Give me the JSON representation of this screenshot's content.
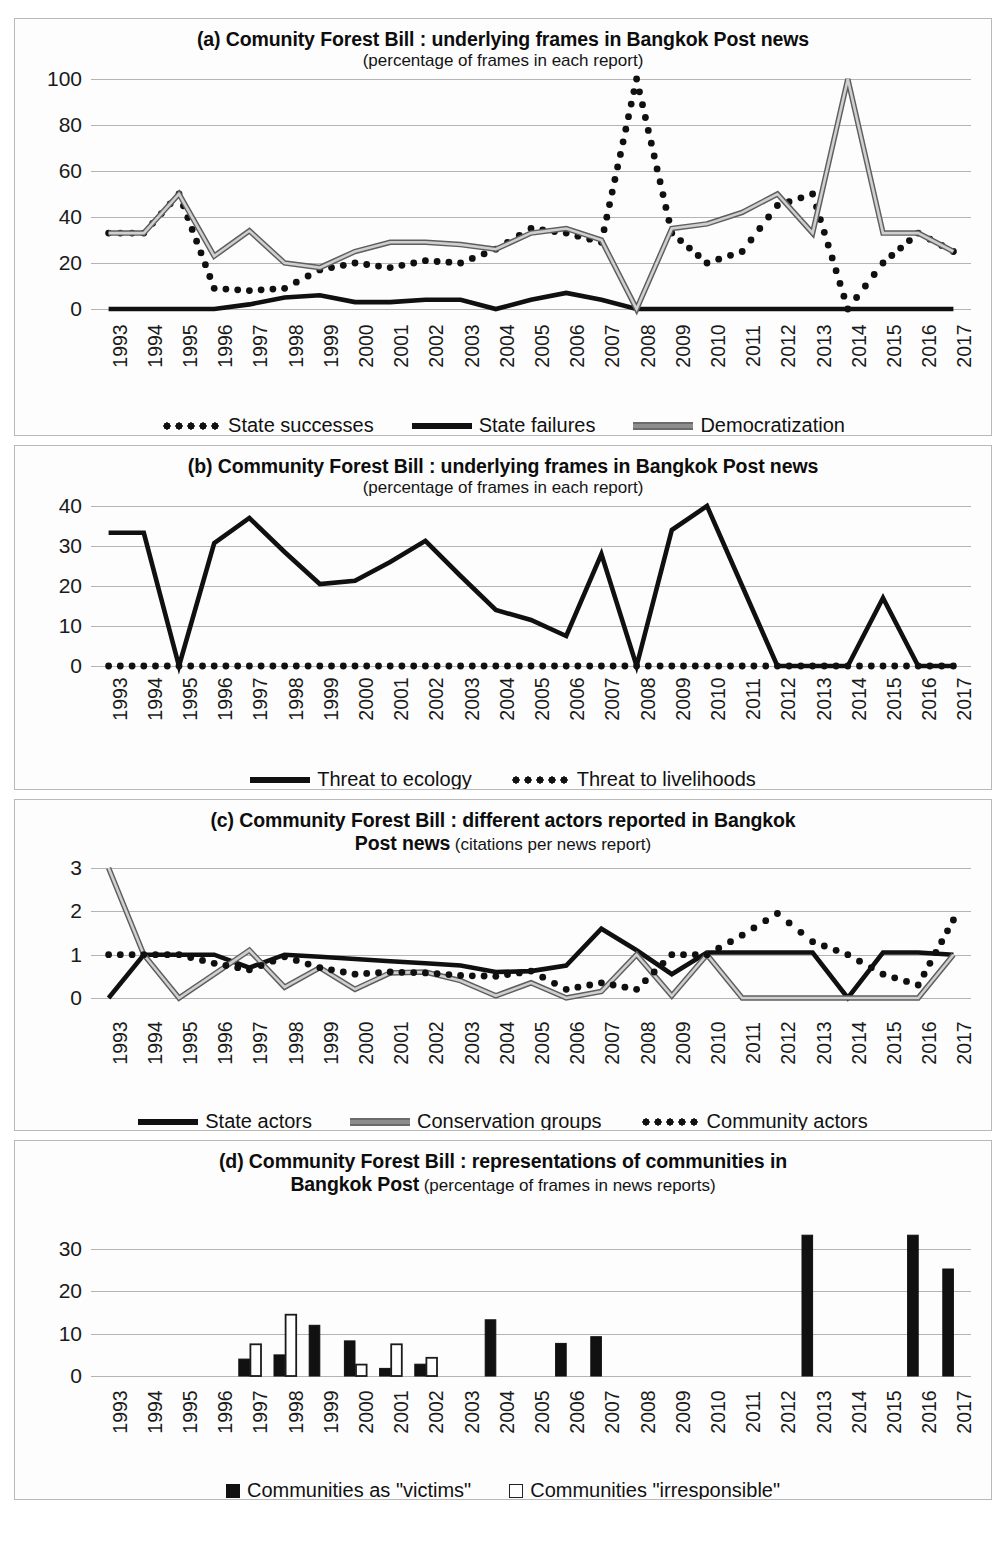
{
  "years": [
    "1993",
    "1994",
    "1995",
    "1996",
    "1997",
    "1998",
    "1999",
    "2000",
    "2001",
    "2002",
    "2003",
    "2004",
    "2005",
    "2006",
    "2007",
    "2008",
    "2009",
    "2010",
    "2011",
    "2012",
    "2013",
    "2014",
    "2015",
    "2016",
    "2017"
  ],
  "colors": {
    "black": "#101010",
    "gray": "#8d8d8d",
    "gridline": "#b4b4b4",
    "panel_border": "#b9b9b9",
    "background": "#ffffff"
  },
  "panel_a": {
    "title_main": "(a) Comunity Forest Bill : underlying frames in Bangkok Post news",
    "title_sub": "(percentage of frames in each report)",
    "legend": [
      {
        "label": "State successes",
        "style": "dotted"
      },
      {
        "label": "State failures",
        "style": "solid"
      },
      {
        "label": "Democratization",
        "style": "gray"
      }
    ]
  },
  "panel_b": {
    "title_main": "(b) Community Forest Bill : underlying frames in Bangkok Post news",
    "title_sub": "(percentage of frames in each report)",
    "legend": [
      {
        "label": "Threat to ecology",
        "style": "solid"
      },
      {
        "label": "Threat to livelihoods",
        "style": "dotted"
      }
    ]
  },
  "panel_c": {
    "title_main": "(c) Community Forest Bill : different actors reported in Bangkok",
    "title_main2": "Post news",
    "title_sub": "(citations per news report)",
    "legend": [
      {
        "label": "State actors",
        "style": "solid"
      },
      {
        "label": "Conservation groups",
        "style": "gray"
      },
      {
        "label": "Community actors",
        "style": "dotted"
      }
    ]
  },
  "panel_d": {
    "title_main": "(d) Community Forest Bill : representations of communities in",
    "title_main2": "Bangkok Post",
    "title_sub": "(percentage of frames in news reports)",
    "legend": [
      {
        "label": "Communities as \"victims\"",
        "style": "bar-filled"
      },
      {
        "label": "Communities \"irresponsible\"",
        "style": "bar-open"
      }
    ]
  },
  "chart_data": [
    {
      "panel": "a",
      "type": "line",
      "title": "(a) Comunity Forest Bill : underlying frames in Bangkok Post news",
      "subtitle": "(percentage of frames in each report)",
      "xlabel": "",
      "ylabel": "",
      "ylim": [
        0,
        100
      ],
      "yticks": [
        0,
        20,
        40,
        60,
        80,
        100
      ],
      "grid": true,
      "legend_position": "bottom",
      "x": [
        "1993",
        "1994",
        "1995",
        "1996",
        "1997",
        "1998",
        "1999",
        "2000",
        "2001",
        "2002",
        "2003",
        "2004",
        "2005",
        "2006",
        "2007",
        "2008",
        "2009",
        "2010",
        "2011",
        "2012",
        "2013",
        "2014",
        "2015",
        "2016",
        "2017"
      ],
      "series": [
        {
          "name": "State successes",
          "style": "dotted",
          "values": [
            33,
            33,
            50,
            9,
            8,
            9,
            17,
            20,
            18,
            21,
            20,
            26,
            35,
            33,
            29,
            100,
            33,
            20,
            25,
            45,
            50,
            0,
            20,
            33,
            25
          ]
        },
        {
          "name": "State failures",
          "style": "solid",
          "values": [
            0,
            0,
            0,
            0,
            2,
            5,
            6,
            3,
            3,
            4,
            4,
            0,
            4,
            7,
            4,
            0,
            0,
            0,
            0,
            0,
            0,
            0,
            0,
            0,
            0
          ]
        },
        {
          "name": "Democratization",
          "style": "gray",
          "values": [
            33,
            33,
            50,
            23,
            34,
            20,
            18,
            25,
            29,
            29,
            28,
            26,
            33,
            35,
            30,
            0,
            35,
            37,
            42,
            50,
            33,
            100,
            33,
            33,
            25
          ]
        }
      ]
    },
    {
      "panel": "b",
      "type": "line",
      "title": "(b) Community Forest Bill : underlying frames in Bangkok Post news",
      "subtitle": "(percentage of frames in each report)",
      "xlabel": "",
      "ylabel": "",
      "ylim": [
        0,
        40
      ],
      "yticks": [
        0,
        10,
        20,
        30,
        40
      ],
      "grid": true,
      "legend_position": "bottom",
      "x": [
        "1993",
        "1994",
        "1995",
        "1996",
        "1997",
        "1998",
        "1999",
        "2000",
        "2001",
        "2002",
        "2003",
        "2004",
        "2005",
        "2006",
        "2007",
        "2008",
        "2009",
        "2010",
        "2011",
        "2012",
        "2013",
        "2014",
        "2015",
        "2016",
        "2017"
      ],
      "series": [
        {
          "name": "Threat to ecology",
          "style": "solid",
          "values": [
            33.3,
            33.3,
            0,
            30.7,
            37,
            28.5,
            20.5,
            21.3,
            26,
            31.3,
            22.5,
            14,
            11.5,
            7.5,
            28,
            0,
            34,
            40,
            20,
            0,
            0,
            0,
            17,
            0,
            0
          ]
        },
        {
          "name": "Threat to livelihoods",
          "style": "dotted",
          "values": [
            0,
            0,
            0,
            0,
            0,
            0,
            0,
            0,
            0,
            0,
            0,
            0,
            0,
            0,
            0,
            0,
            0,
            0,
            0,
            0,
            0,
            0,
            0,
            0,
            0
          ]
        }
      ]
    },
    {
      "panel": "c",
      "type": "line",
      "title": "(c) Community Forest Bill : different actors reported in Bangkok Post news",
      "subtitle": "(citations per news report)",
      "xlabel": "",
      "ylabel": "",
      "ylim": [
        0,
        3
      ],
      "yticks": [
        0,
        1,
        2,
        3
      ],
      "grid": true,
      "legend_position": "bottom",
      "x": [
        "1993",
        "1994",
        "1995",
        "1996",
        "1997",
        "1998",
        "1999",
        "2000",
        "2001",
        "2002",
        "2003",
        "2004",
        "2005",
        "2006",
        "2007",
        "2008",
        "2009",
        "2010",
        "2011",
        "2012",
        "2013",
        "2014",
        "2015",
        "2016",
        "2017"
      ],
      "series": [
        {
          "name": "State actors",
          "style": "solid",
          "values": [
            0,
            1,
            1,
            1,
            0.7,
            1,
            0.95,
            0.9,
            0.85,
            0.8,
            0.75,
            0.6,
            0.62,
            0.75,
            1.6,
            1.1,
            0.55,
            1.05,
            1.05,
            1.05,
            1.05,
            0,
            1.05,
            1.05,
            1.0
          ]
        },
        {
          "name": "Conservation groups",
          "style": "gray",
          "values": [
            3,
            1,
            0,
            0.55,
            1.1,
            0.25,
            0.7,
            0.2,
            0.58,
            0.6,
            0.4,
            0.05,
            0.35,
            0,
            0.15,
            1.0,
            0.05,
            1.0,
            0,
            0,
            0,
            0,
            0,
            0,
            1.0
          ]
        },
        {
          "name": "Community actors",
          "style": "dotted",
          "values": [
            1,
            1,
            1,
            0.8,
            0.65,
            0.95,
            0.7,
            0.55,
            0.6,
            0.58,
            0.52,
            0.5,
            0.62,
            0.2,
            0.35,
            0.2,
            1.0,
            1.0,
            1.45,
            1.95,
            1.3,
            1.0,
            0.55,
            0.3,
            1.8
          ]
        }
      ]
    },
    {
      "panel": "d",
      "type": "bar",
      "title": "(d) Community Forest Bill : representations of communities in Bangkok Post",
      "subtitle": "(percentage of frames in news reports)",
      "xlabel": "",
      "ylabel": "",
      "ylim": [
        0,
        35
      ],
      "yticks": [
        0,
        10,
        20,
        30
      ],
      "grid": true,
      "legend_position": "bottom",
      "categories": [
        "1993",
        "1994",
        "1995",
        "1996",
        "1997",
        "1998",
        "1999",
        "2000",
        "2001",
        "2002",
        "2003",
        "2004",
        "2005",
        "2006",
        "2007",
        "2008",
        "2009",
        "2010",
        "2011",
        "2012",
        "2013",
        "2014",
        "2015",
        "2016",
        "2017"
      ],
      "series": [
        {
          "name": "Communities as \"victims\"",
          "style": "bar-filled",
          "values": [
            0,
            0,
            0,
            0,
            4,
            5,
            12,
            8.3,
            1.8,
            2.8,
            0,
            13.3,
            0,
            7.7,
            9.3,
            0,
            0,
            0,
            0,
            0,
            33.3,
            0,
            0,
            33.3,
            25.3
          ]
        },
        {
          "name": "Communities \"irresponsible\"",
          "style": "bar-open",
          "values": [
            0,
            0,
            0,
            0,
            7.5,
            14.5,
            0,
            2.7,
            7.5,
            4.3,
            0,
            0,
            0,
            0,
            0,
            0,
            0,
            0,
            0,
            0,
            0,
            0,
            0,
            0,
            0
          ]
        }
      ]
    }
  ]
}
